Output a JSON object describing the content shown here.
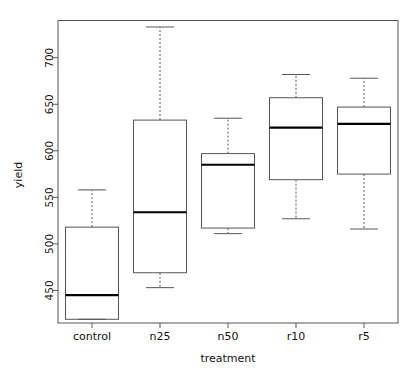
{
  "chart_data": {
    "type": "box",
    "title": "",
    "xlabel": "treatment",
    "ylabel": "yield",
    "categories": [
      "control",
      "n25",
      "n50",
      "r10",
      "r5"
    ],
    "ylim": [
      415,
      740
    ],
    "yticks": [
      450,
      500,
      550,
      600,
      650,
      700
    ],
    "ytick_labels": [
      "450",
      "500",
      "550",
      "600",
      "650",
      "700"
    ],
    "grid": false,
    "legend": "none",
    "boxes": [
      {
        "category": "control",
        "whisker_low": 419,
        "q1": 419,
        "median": 445,
        "q3": 518,
        "whisker_high": 558
      },
      {
        "category": "n25",
        "whisker_low": 453,
        "q1": 469,
        "median": 534,
        "q3": 633,
        "whisker_high": 733
      },
      {
        "category": "n50",
        "whisker_low": 511,
        "q1": 517,
        "median": 585,
        "q3": 597,
        "whisker_high": 635
      },
      {
        "category": "r10",
        "whisker_low": 527,
        "q1": 569,
        "median": 625,
        "q3": 657,
        "whisker_high": 682
      },
      {
        "category": "r5",
        "whisker_low": 516,
        "q1": 575,
        "median": 629,
        "q3": 647,
        "whisker_high": 678
      }
    ],
    "style": {
      "box_stroke": "#555555",
      "median_stroke": "#000000",
      "whisker_stroke": "#555555",
      "axis_stroke": "#555555",
      "background": "#ffffff"
    }
  }
}
